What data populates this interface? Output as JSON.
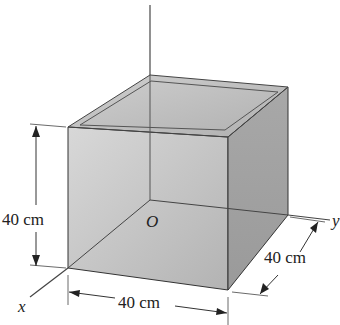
{
  "figure": {
    "type": "isometric open-top cubic box with coordinate axes",
    "axes": {
      "x_label": "x",
      "y_label": "y",
      "origin_label": "O"
    },
    "dimensions": {
      "height": "40 cm",
      "width": "40 cm",
      "depth": "40 cm"
    },
    "colors": {
      "front_face": "#c4c4c4",
      "right_face": "#a9a9a9",
      "inner_floor": "#b8b8b8",
      "rim": "#e6e6e6",
      "lines": "#333333"
    }
  }
}
